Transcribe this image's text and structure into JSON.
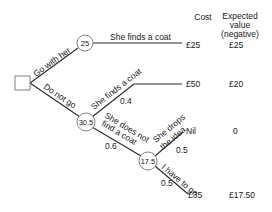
{
  "diagram": {
    "type": "decision-tree",
    "headers": {
      "cost": "Cost",
      "expected_value_line1": "Expected",
      "expected_value_line2": "value",
      "expected_value_line3": "(negative)"
    },
    "decision_node": {
      "shape": "square"
    },
    "chance_nodes": [
      {
        "id": "n1",
        "value": "25"
      },
      {
        "id": "n2",
        "value": "30.5"
      },
      {
        "id": "n3",
        "value": "17.5"
      }
    ],
    "branches": {
      "go_with_her": "Go with her",
      "do_not_go": "Do not go",
      "she_finds_coat_1": "She finds a coat",
      "she_finds_coat_2": "She finds a coat",
      "she_finds_coat_2_prob": "0.4",
      "she_does_not_find_line1": "She does not",
      "she_does_not_find_line2": "find a coat",
      "she_does_not_find_prob": "0.6",
      "she_drops_line1": "She drops",
      "she_drops_line2": "the idea",
      "she_drops_prob": "0.5",
      "i_have_to_go": "I have to go",
      "i_have_to_go_prob": "0.5"
    },
    "outcomes": [
      {
        "cost": "£25",
        "expected": "£25"
      },
      {
        "cost": "£50",
        "expected": "£20"
      },
      {
        "cost": "Nil",
        "expected": "0"
      },
      {
        "cost": "£35",
        "expected": "£17.50"
      }
    ]
  }
}
